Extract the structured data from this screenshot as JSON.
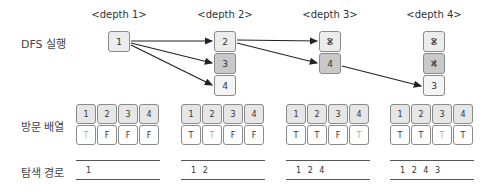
{
  "row_labels": {
    "dfs": "DFS 실행",
    "visited": "방문 배열",
    "path": "탐색 경로"
  },
  "columns": [
    {
      "depth_label": "<depth 1>",
      "nodes": [
        {
          "label": "1",
          "style": "light",
          "crossed": false
        }
      ],
      "visited": {
        "indices": [
          "1",
          "2",
          "3",
          "4"
        ],
        "values": [
          "T",
          "F",
          "F",
          "F"
        ],
        "fresh": [
          true,
          false,
          false,
          false
        ]
      },
      "path": "1"
    },
    {
      "depth_label": "<depth 2>",
      "nodes": [
        {
          "label": "2",
          "style": "light",
          "crossed": false
        },
        {
          "label": "3",
          "style": "mid",
          "crossed": false
        },
        {
          "label": "4",
          "style": "pale",
          "crossed": false
        }
      ],
      "visited": {
        "indices": [
          "1",
          "2",
          "3",
          "4"
        ],
        "values": [
          "T",
          "T",
          "F",
          "F"
        ],
        "fresh": [
          false,
          true,
          false,
          false
        ]
      },
      "path": "1 2"
    },
    {
      "depth_label": "<depth 3>",
      "nodes": [
        {
          "label": "2",
          "style": "light",
          "crossed": true
        },
        {
          "label": "4",
          "style": "mid",
          "crossed": false
        }
      ],
      "visited": {
        "indices": [
          "1",
          "2",
          "3",
          "4"
        ],
        "values": [
          "T",
          "T",
          "F",
          "T"
        ],
        "fresh": [
          false,
          false,
          false,
          true
        ]
      },
      "path": "1 2 4"
    },
    {
      "depth_label": "<depth 4>",
      "nodes": [
        {
          "label": "2",
          "style": "light",
          "crossed": true
        },
        {
          "label": "4",
          "style": "mid",
          "crossed": true
        },
        {
          "label": "3",
          "style": "pale",
          "crossed": false
        }
      ],
      "visited": {
        "indices": [
          "1",
          "2",
          "3",
          "4"
        ],
        "values": [
          "T",
          "T",
          "T",
          "T"
        ],
        "fresh": [
          false,
          false,
          true,
          false
        ]
      },
      "path": "1 2 4 3"
    }
  ],
  "edges": [
    {
      "from": "d1-1",
      "to": "d2-2"
    },
    {
      "from": "d1-1",
      "to": "d2-3"
    },
    {
      "from": "d1-1",
      "to": "d2-4"
    },
    {
      "from": "d2-2",
      "to": "d3-2"
    },
    {
      "from": "d2-2",
      "to": "d3-4"
    },
    {
      "from": "d3-4",
      "to": "d4-3"
    }
  ]
}
